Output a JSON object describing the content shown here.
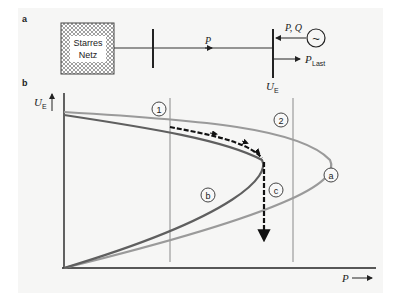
{
  "panel_a": {
    "label": "a",
    "grid_box": {
      "line1": "Starres",
      "line2": "Netz"
    },
    "line_power_label": "P",
    "generator_label": "P, Q",
    "generator_symbol": "~",
    "load_label": "P",
    "load_subscript": "Last",
    "bus_voltage_label": "U",
    "bus_voltage_subscript": "E"
  },
  "panel_b": {
    "label": "b",
    "y_axis_label": "U",
    "y_axis_subscript": "E",
    "x_axis_label": "P",
    "markers": {
      "line1": "1",
      "line2": "2",
      "curve_a": "a",
      "curve_b": "b",
      "path_c": "c"
    },
    "colors": {
      "curve_a": "#9a9a9a",
      "curve_b": "#5f5f5f",
      "path": "#111111",
      "vertical_lines": "#8a8a8a"
    }
  }
}
